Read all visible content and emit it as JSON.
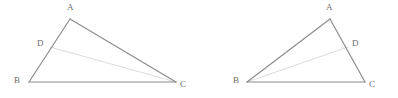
{
  "figure": {
    "width": 398,
    "height": 98,
    "background_color": "#ffffff",
    "side_color": "#8c8c8c",
    "cevian_color": "#dcdcdc",
    "label_color": "#6e6e6e",
    "side_width": 1.2,
    "cevian_width": 1.0,
    "diagrams": [
      {
        "id": "left-triangle",
        "name": "triangle-abc-with-cevian-dc",
        "points": {
          "A": {
            "x": 70,
            "y": 19
          },
          "B": {
            "x": 29,
            "y": 82
          },
          "C": {
            "x": 176,
            "y": 82
          },
          "D": {
            "x": 50,
            "y": 47
          }
        },
        "sides": [
          {
            "name": "side-ab",
            "from": "A",
            "to": "B"
          },
          {
            "name": "side-ac",
            "from": "A",
            "to": "C"
          },
          {
            "name": "side-bc",
            "from": "B",
            "to": "C"
          }
        ],
        "cevians": [
          {
            "name": "cevian-dc",
            "from": "D",
            "to": "C"
          }
        ],
        "labels": [
          {
            "name": "label-a",
            "text": "A",
            "x": 67,
            "y": 3
          },
          {
            "name": "label-b",
            "text": "B",
            "x": 14,
            "y": 76
          },
          {
            "name": "label-c",
            "text": "C",
            "x": 180,
            "y": 80
          },
          {
            "name": "label-d",
            "text": "D",
            "x": 37,
            "y": 39
          }
        ]
      },
      {
        "id": "right-triangle",
        "name": "triangle-abc-with-cevian-bd",
        "points": {
          "A": {
            "x": 330,
            "y": 19
          },
          "B": {
            "x": 247,
            "y": 82
          },
          "C": {
            "x": 365,
            "y": 82
          },
          "D": {
            "x": 348,
            "y": 47
          }
        },
        "sides": [
          {
            "name": "side-ab",
            "from": "A",
            "to": "B"
          },
          {
            "name": "side-ac",
            "from": "A",
            "to": "C"
          },
          {
            "name": "side-bc",
            "from": "B",
            "to": "C"
          }
        ],
        "cevians": [
          {
            "name": "cevian-bd",
            "from": "B",
            "to": "D"
          }
        ],
        "labels": [
          {
            "name": "label-a",
            "text": "A",
            "x": 326,
            "y": 3
          },
          {
            "name": "label-b",
            "text": "B",
            "x": 233,
            "y": 76
          },
          {
            "name": "label-c",
            "text": "C",
            "x": 369,
            "y": 80
          },
          {
            "name": "label-d",
            "text": "D",
            "x": 352,
            "y": 39
          }
        ]
      }
    ]
  }
}
